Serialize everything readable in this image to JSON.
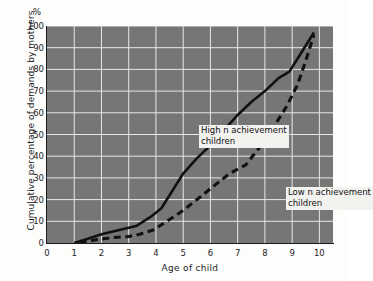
{
  "chart_data": {
    "type": "line",
    "title": "",
    "subtitle": "",
    "xlabel": "Age of child",
    "ylabel": "Cumulative percentage of demands by mothers",
    "y_unit_symbol": "%",
    "xlim": [
      0,
      10.5
    ],
    "ylim": [
      0,
      100
    ],
    "xticks": [
      0,
      1,
      2,
      3,
      4,
      5,
      6,
      7,
      8,
      9,
      10
    ],
    "yticks": [
      0,
      10,
      20,
      30,
      40,
      50,
      60,
      70,
      80,
      90,
      100
    ],
    "grid": true,
    "grid_color": "#e8e8e8",
    "plot_background": "#767676",
    "legend_position": "inline-annotations",
    "series": [
      {
        "name": "High n achievement children",
        "style": "solid",
        "color": "#111111",
        "x": [
          1.0,
          1.5,
          2.0,
          2.5,
          3.0,
          3.3,
          3.8,
          4.2,
          4.5,
          5.0,
          5.5,
          6.0,
          6.5,
          7.0,
          7.5,
          8.0,
          8.5,
          8.9,
          9.3,
          9.8
        ],
        "y": [
          0,
          2,
          4,
          5.5,
          7,
          8,
          12,
          16,
          22,
          32,
          39,
          45,
          52,
          59,
          65,
          70,
          76,
          79,
          87,
          97
        ]
      },
      {
        "name": "Low n achievement children",
        "style": "dashed",
        "color": "#111111",
        "x": [
          1.2,
          1.8,
          2.4,
          3.0,
          3.4,
          3.9,
          4.4,
          5.0,
          5.6,
          6.2,
          6.7,
          7.0,
          7.3,
          7.8,
          8.3,
          8.8,
          9.2,
          9.5,
          9.8
        ],
        "y": [
          0,
          1.5,
          2.5,
          3,
          4,
          6,
          10,
          15,
          21,
          27,
          32,
          34,
          36,
          44,
          53,
          63,
          73,
          84,
          96
        ]
      }
    ],
    "annotations": [
      {
        "id": "high-n",
        "line1": "High  n  achievement",
        "line2": "children",
        "x_px": 152,
        "y_px": 99
      },
      {
        "id": "low-n",
        "line1": "Low  n  achievement",
        "line2": "children",
        "x_px": 239,
        "y_px": 161
      }
    ]
  },
  "axes": {
    "y_unit": "%",
    "x_title": "Age of child",
    "y_title": "Cumulative percentage of demands by mothers"
  }
}
